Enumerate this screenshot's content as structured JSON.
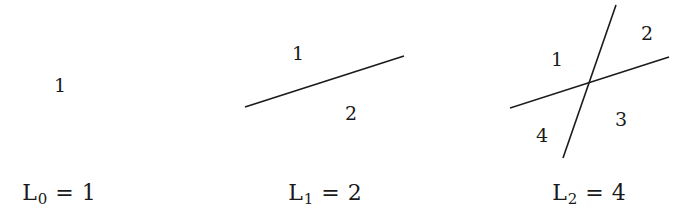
{
  "panels": [
    {
      "id": "L0",
      "lines": [],
      "regions": [
        {
          "label": "1",
          "x": 60,
          "y": 85
        }
      ],
      "equation": {
        "symbol": "L",
        "subscript": "0",
        "operator": "=",
        "value": "1",
        "cx": 59
      }
    },
    {
      "id": "L1",
      "lines": [
        {
          "x1": 245,
          "y1": 107,
          "x2": 404,
          "y2": 56
        }
      ],
      "regions": [
        {
          "label": "1",
          "x": 298,
          "y": 53
        },
        {
          "label": "2",
          "x": 351,
          "y": 113
        }
      ],
      "equation": {
        "symbol": "L",
        "subscript": "1",
        "operator": "=",
        "value": "2",
        "cx": 325
      }
    },
    {
      "id": "L2",
      "lines": [
        {
          "x1": 510,
          "y1": 108,
          "x2": 669,
          "y2": 57
        },
        {
          "x1": 563,
          "y1": 158,
          "x2": 616,
          "y2": 5
        }
      ],
      "regions": [
        {
          "label": "1",
          "x": 557,
          "y": 59
        },
        {
          "label": "2",
          "x": 647,
          "y": 33
        },
        {
          "label": "3",
          "x": 621,
          "y": 119
        },
        {
          "label": "4",
          "x": 542,
          "y": 135
        }
      ],
      "equation": {
        "symbol": "L",
        "subscript": "2",
        "operator": "=",
        "value": "4",
        "cx": 589
      }
    }
  ],
  "style": {
    "stroke": "#1a1a1a",
    "stroke_width": 1.6
  }
}
